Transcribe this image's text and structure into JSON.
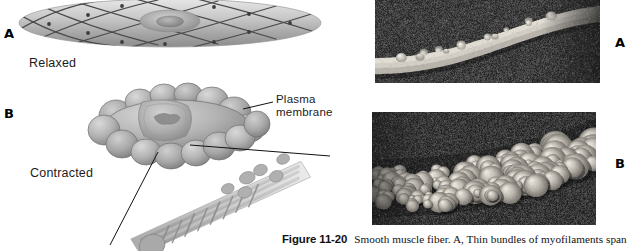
{
  "figure": {
    "number": "Figure 11-20",
    "title": "Smooth muscle fiber.",
    "panel_a_text": "A,",
    "caption_rest": "Thin bundles of myofilaments span",
    "full_caption": "Figure 11-20  Smooth muscle fiber. A, Thin bundles of myofilaments span"
  },
  "diagram": {
    "panel_a_letter": "A",
    "panel_b_letter": "B",
    "relaxed_label": "Relaxed",
    "contracted_label": "Contracted",
    "callouts": [
      {
        "line1": "Plasma",
        "line2": "membrane"
      }
    ]
  },
  "micrographs": {
    "panel_a_letter": "A",
    "panel_b_letter": "B"
  },
  "colors": {
    "page_background": "#ffffff",
    "text": "#141414",
    "cell_fill_light": "#d8d8d8",
    "cell_fill_mid": "#b4b4b4",
    "cell_fill_dark": "#8e8e8e",
    "cell_outline": "#3a3a3a",
    "nucleus": "#9a9a9a",
    "micrograph_background": "#2b2b2b",
    "micrograph_specimen": "#cfcfcf"
  }
}
